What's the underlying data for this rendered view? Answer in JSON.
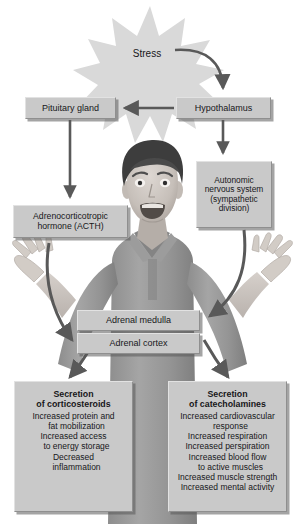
{
  "diagram": {
    "stressor": {
      "label": "Stress",
      "shape": "starburst"
    },
    "nodes": [
      {
        "id": "pituitary",
        "label": "Pituitary gland"
      },
      {
        "id": "hypothalamus",
        "label": "Hypothalamus"
      },
      {
        "id": "autonomic",
        "lines": [
          "Autonomic",
          "nervous system",
          "(sympathetic",
          "division)"
        ]
      },
      {
        "id": "acth",
        "lines": [
          "Adrenocorticotropic",
          "hormone (ACTH)"
        ]
      },
      {
        "id": "medulla",
        "label": "Adrenal medulla"
      },
      {
        "id": "cortex",
        "label": "Adrenal cortex"
      }
    ],
    "outcomes": [
      {
        "id": "corticosteroids",
        "heading_line1": "Secretion",
        "heading_line2": "of corticosteroids",
        "items": [
          {
            "text": "Increased protein and",
            "indent": false
          },
          {
            "text": "fat mobilization",
            "indent": true
          },
          {
            "text": "Increased access",
            "indent": false
          },
          {
            "text": "to energy storage",
            "indent": true
          },
          {
            "text": "Decreased",
            "indent": false
          },
          {
            "text": "inflammation",
            "indent": true
          }
        ]
      },
      {
        "id": "catecholamines",
        "heading_line1": "Secretion",
        "heading_line2": "of catecholamines",
        "items": [
          {
            "text": "Increased cardiovascular",
            "indent": false
          },
          {
            "text": "response",
            "indent": true
          },
          {
            "text": "Increased respiration",
            "indent": false
          },
          {
            "text": "Increased perspiration",
            "indent": false
          },
          {
            "text": "Increased blood flow",
            "indent": false
          },
          {
            "text": "to active muscles",
            "indent": true
          },
          {
            "text": "Increased muscle strength",
            "indent": false
          },
          {
            "text": "Increased mental activity",
            "indent": false
          }
        ]
      }
    ],
    "image": {
      "name": "stressed-man-photo",
      "description": "Grayscale photo of a man with raised hands and an alarmed expression"
    },
    "colors": {
      "box_fill": "#c9c9c9",
      "box_highlight": "#e2e2e2",
      "box_shade": "#8f8f8f",
      "arrow": "#595959",
      "burst_fill": "#d9d9d9",
      "text": "#17171a",
      "background": "#ffffff"
    }
  }
}
